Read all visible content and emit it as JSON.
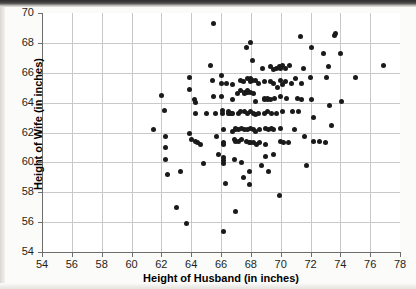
{
  "chart_data": {
    "type": "scatter",
    "title": "",
    "xlabel": "Height of Husband (in inches)",
    "ylabel": "Height of Wife (in inches)",
    "xlim": [
      54,
      78
    ],
    "ylim": [
      54,
      70
    ],
    "xticks": [
      54,
      56,
      58,
      60,
      62,
      64,
      66,
      68,
      70,
      72,
      74,
      76,
      78
    ],
    "yticks": [
      54,
      56,
      58,
      60,
      62,
      64,
      66,
      68,
      70
    ],
    "grid": true,
    "legend": null,
    "marker": {
      "shape": "circle",
      "color": "#1a1a1a",
      "size": 5
    },
    "series": [
      {
        "name": "Husband-Wife heights",
        "points": [
          [
            61.5,
            62.2
          ],
          [
            62.0,
            64.5
          ],
          [
            62.2,
            63.5
          ],
          [
            62.3,
            61.7
          ],
          [
            62.3,
            61.0
          ],
          [
            62.3,
            60.2
          ],
          [
            62.4,
            59.2
          ],
          [
            63.0,
            57.0
          ],
          [
            63.3,
            59.4
          ],
          [
            63.7,
            55.9
          ],
          [
            63.9,
            65.7
          ],
          [
            63.9,
            64.9
          ],
          [
            63.9,
            61.9
          ],
          [
            64.0,
            61.5
          ],
          [
            64.2,
            64.2
          ],
          [
            64.3,
            64.0
          ],
          [
            64.3,
            63.3
          ],
          [
            64.3,
            61.4
          ],
          [
            64.4,
            61.3
          ],
          [
            64.6,
            61.2
          ],
          [
            64.8,
            59.9
          ],
          [
            65.0,
            63.3
          ],
          [
            65.3,
            66.5
          ],
          [
            65.4,
            65.5
          ],
          [
            65.5,
            69.3
          ],
          [
            65.5,
            64.4
          ],
          [
            65.6,
            63.3
          ],
          [
            65.7,
            61.7
          ],
          [
            65.8,
            60.5
          ],
          [
            66.0,
            65.8
          ],
          [
            66.0,
            65.3
          ],
          [
            66.0,
            64.4
          ],
          [
            66.1,
            63.5
          ],
          [
            66.1,
            63.3
          ],
          [
            66.2,
            62.2
          ],
          [
            66.2,
            61.3
          ],
          [
            66.2,
            61.2
          ],
          [
            66.2,
            60.3
          ],
          [
            66.2,
            60.1
          ],
          [
            66.2,
            59.9
          ],
          [
            66.2,
            55.4
          ],
          [
            66.3,
            58.6
          ],
          [
            66.4,
            65.3
          ],
          [
            66.5,
            63.4
          ],
          [
            66.5,
            63.3
          ],
          [
            66.6,
            63.3
          ],
          [
            66.7,
            63.3
          ],
          [
            66.8,
            65.2
          ],
          [
            66.8,
            64.2
          ],
          [
            66.8,
            63.3
          ],
          [
            66.8,
            62.1
          ],
          [
            66.9,
            61.5
          ],
          [
            66.9,
            60.2
          ],
          [
            67.0,
            62.3
          ],
          [
            67.0,
            62.2
          ],
          [
            67.0,
            61.4
          ],
          [
            67.0,
            56.7
          ],
          [
            67.1,
            64.6
          ],
          [
            67.2,
            63.3
          ],
          [
            67.2,
            62.2
          ],
          [
            67.2,
            61.4
          ],
          [
            67.3,
            65.5
          ],
          [
            67.3,
            64.8
          ],
          [
            67.3,
            63.4
          ],
          [
            67.4,
            62.3
          ],
          [
            67.4,
            61.5
          ],
          [
            67.4,
            60.0
          ],
          [
            67.5,
            59.0
          ],
          [
            67.5,
            65.4
          ],
          [
            67.6,
            64.7
          ],
          [
            67.6,
            64.6
          ],
          [
            67.6,
            63.4
          ],
          [
            67.6,
            62.2
          ],
          [
            67.7,
            61.4
          ],
          [
            67.7,
            67.7
          ],
          [
            67.8,
            65.6
          ],
          [
            67.8,
            64.8
          ],
          [
            67.8,
            64.7
          ],
          [
            67.8,
            63.3
          ],
          [
            67.8,
            62.2
          ],
          [
            67.9,
            61.3
          ],
          [
            67.9,
            59.4
          ],
          [
            67.9,
            58.5
          ],
          [
            68.0,
            68.0
          ],
          [
            68.0,
            65.6
          ],
          [
            68.0,
            65.4
          ],
          [
            68.0,
            64.7
          ],
          [
            68.0,
            63.4
          ],
          [
            68.0,
            62.3
          ],
          [
            68.0,
            61.3
          ],
          [
            68.1,
            66.8
          ],
          [
            68.1,
            65.5
          ],
          [
            68.2,
            64.6
          ],
          [
            68.2,
            63.3
          ],
          [
            68.2,
            62.2
          ],
          [
            68.2,
            61.3
          ],
          [
            68.3,
            65.5
          ],
          [
            68.3,
            64.1
          ],
          [
            68.3,
            63.2
          ],
          [
            68.3,
            62.1
          ],
          [
            68.4,
            61.2
          ],
          [
            68.5,
            65.3
          ],
          [
            68.5,
            63.3
          ],
          [
            68.6,
            62.2
          ],
          [
            68.6,
            61.3
          ],
          [
            68.7,
            59.8
          ],
          [
            68.8,
            66.3
          ],
          [
            68.9,
            65.4
          ],
          [
            68.9,
            64.3
          ],
          [
            68.9,
            64.2
          ],
          [
            68.9,
            63.3
          ],
          [
            69.0,
            62.3
          ],
          [
            69.0,
            61.2
          ],
          [
            69.0,
            60.4
          ],
          [
            69.1,
            64.3
          ],
          [
            69.1,
            64.2
          ],
          [
            69.1,
            63.4
          ],
          [
            69.2,
            62.2
          ],
          [
            69.2,
            59.4
          ],
          [
            69.3,
            66.4
          ],
          [
            69.3,
            65.4
          ],
          [
            69.3,
            64.2
          ],
          [
            69.4,
            63.3
          ],
          [
            69.4,
            62.3
          ],
          [
            69.5,
            66.2
          ],
          [
            69.5,
            65.3
          ],
          [
            69.5,
            62.2
          ],
          [
            69.5,
            60.5
          ],
          [
            69.6,
            64.3
          ],
          [
            69.7,
            66.3
          ],
          [
            69.7,
            63.3
          ],
          [
            69.8,
            65.0
          ],
          [
            69.9,
            66.4
          ],
          [
            69.9,
            57.8
          ],
          [
            70.0,
            66.3
          ],
          [
            70.0,
            65.5
          ],
          [
            70.0,
            64.4
          ],
          [
            70.0,
            62.3
          ],
          [
            70.0,
            61.4
          ],
          [
            70.1,
            66.5
          ],
          [
            70.1,
            65.2
          ],
          [
            70.1,
            63.4
          ],
          [
            70.2,
            61.3
          ],
          [
            70.3,
            66.3
          ],
          [
            70.3,
            65.4
          ],
          [
            70.4,
            64.3
          ],
          [
            70.5,
            61.3
          ],
          [
            70.6,
            66.5
          ],
          [
            70.7,
            65.3
          ],
          [
            70.8,
            63.4
          ],
          [
            70.9,
            62.2
          ],
          [
            71.0,
            65.6
          ],
          [
            71.1,
            64.3
          ],
          [
            71.2,
            63.4
          ],
          [
            71.3,
            68.4
          ],
          [
            71.4,
            65.3
          ],
          [
            71.4,
            64.2
          ],
          [
            71.5,
            66.3
          ],
          [
            71.6,
            61.7
          ],
          [
            71.7,
            59.8
          ],
          [
            72.0,
            65.7
          ],
          [
            72.1,
            67.7
          ],
          [
            72.1,
            64.2
          ],
          [
            72.2,
            63.0
          ],
          [
            72.2,
            61.4
          ],
          [
            72.6,
            61.4
          ],
          [
            72.9,
            67.3
          ],
          [
            73.0,
            61.3
          ],
          [
            73.1,
            65.7
          ],
          [
            73.2,
            66.4
          ],
          [
            73.3,
            63.8
          ],
          [
            73.4,
            62.5
          ],
          [
            73.6,
            68.5
          ],
          [
            73.7,
            68.6
          ],
          [
            74.0,
            67.3
          ],
          [
            74.1,
            64.1
          ],
          [
            75.0,
            65.7
          ],
          [
            76.9,
            66.5
          ]
        ]
      }
    ]
  }
}
